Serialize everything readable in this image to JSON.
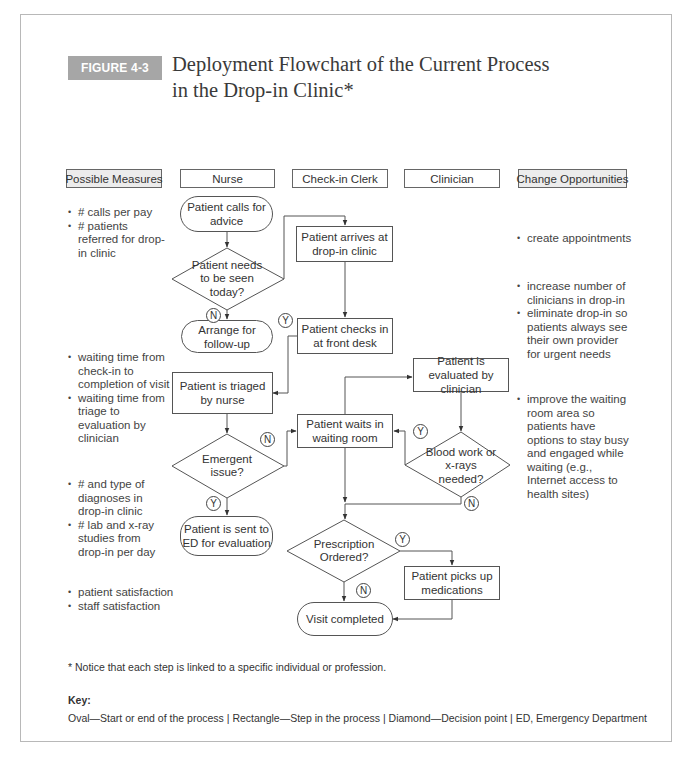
{
  "figure": {
    "label": "FIGURE 4-3",
    "title_line1": "Deployment Flowchart of the Current Process",
    "title_line2": "in the Drop-in Clinic*"
  },
  "columns": {
    "possible_measures": "Possible Measures",
    "nurse": "Nurse",
    "checkin_clerk": "Check-in Clerk",
    "clinician": "Clinician",
    "change_opportunities": "Change Opportunities"
  },
  "nodes": {
    "calls": "Patient calls for advice",
    "needs_seen": "Patient needs to be seen today?",
    "arrange": "Arrange for follow-up",
    "arrives": "Patient arrives at drop-in clinic",
    "checks_in": "Patient checks in at front desk",
    "triaged": "Patient is triaged by nurse",
    "emergent": "Emergent issue?",
    "sent_ed": "Patient is sent to ED for evaluation",
    "waits": "Patient waits in waiting room",
    "evaluated": "Patient is evaluated by clinician",
    "blood": "Blood work or x-rays needed?",
    "prescription": "Prescription Ordered?",
    "picks_up": "Patient picks up medications",
    "completed": "Visit completed"
  },
  "branch_labels": {
    "yes": "Y",
    "no": "N"
  },
  "possible_measures": {
    "group1": [
      "# calls per pay",
      "# patients referred for drop-in clinic"
    ],
    "group2": [
      "waiting time from check-in to completion of visit",
      "waiting time from triage to evaluation by clinician"
    ],
    "group3": [
      "# and type of diagnoses in drop-in clinic",
      "# lab and x-ray studies from drop-in per day"
    ],
    "group4": [
      "patient satisfaction",
      "staff satisfaction"
    ]
  },
  "change_opportunities": {
    "group1": [
      "create appointments"
    ],
    "group2": [
      "increase number of clinicians in drop-in",
      "eliminate drop-in so patients always see their own provider for urgent needs"
    ],
    "group3": [
      "improve the waiting room area so patients have options to stay busy and engaged while waiting (e.g., Internet access to health sites)"
    ]
  },
  "footnote": "* Notice that each step is linked to a specific individual or profession.",
  "key": {
    "title": "Key:",
    "text": "Oval—Start or end of the process  |  Rectangle—Step in the process  |  Diamond—Decision point  |  ED, Emergency Department"
  }
}
